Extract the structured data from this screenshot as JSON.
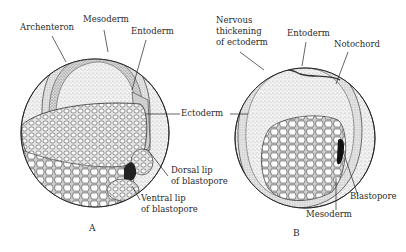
{
  "figure": {
    "panels": [
      {
        "id": "A",
        "caption": "A",
        "labels": {
          "archenteron": "Archenteron",
          "mesoderm": "Mesoderm",
          "entoderm": "Entoderm",
          "ectoderm": "Ectoderm",
          "dorsal_lip_1": "Dorsal lip",
          "dorsal_lip_2": "of blastopore",
          "ventral_lip_1": "Ventral lip",
          "ventral_lip_2": "of blastopore"
        }
      },
      {
        "id": "B",
        "caption": "B",
        "labels": {
          "nervous_1": "Nervous",
          "nervous_2": "thickening",
          "nervous_3": "of ectoderm",
          "entoderm": "Entoderm",
          "notochord": "Notochord",
          "blastopore": "Blastopore",
          "mesoderm": "Mesoderm"
        }
      }
    ],
    "colors": {
      "ink": "#2a2a2a",
      "background": "#ffffff",
      "stipple": "#9a9a9a"
    }
  }
}
